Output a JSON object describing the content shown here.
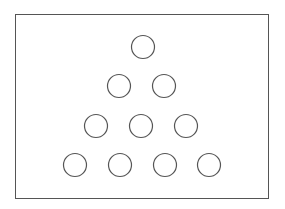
{
  "diagram": {
    "stroke_color": "#555555",
    "frame": {
      "x": 15,
      "y": 14,
      "width": 253,
      "height": 184
    },
    "circle_radius": 11.5,
    "rows": [
      {
        "count": 1,
        "y": 47,
        "x": [
          143
        ]
      },
      {
        "count": 2,
        "y": 86,
        "x": [
          119,
          164
        ]
      },
      {
        "count": 3,
        "y": 126,
        "x": [
          96,
          141,
          186
        ]
      },
      {
        "count": 4,
        "y": 165,
        "x": [
          75,
          120,
          165,
          209
        ]
      }
    ],
    "total_circles": 10
  }
}
